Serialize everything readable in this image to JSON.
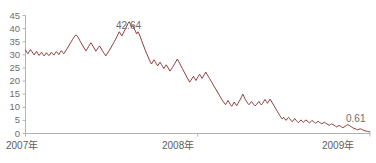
{
  "chart_data": {
    "type": "line",
    "title": "",
    "subtitle": "",
    "xlabel": "",
    "ylabel": "",
    "ylim": [
      0,
      45
    ],
    "ytick_values": [
      0,
      5,
      10,
      15,
      20,
      25,
      30,
      35,
      40,
      45
    ],
    "ytick_labels": [
      "0",
      "5",
      "10",
      "15",
      "20",
      "25",
      "30",
      "35",
      "40",
      "45"
    ],
    "xtick_labels": [
      "2007年",
      "2008年",
      "2009年"
    ],
    "xtick_positions": [
      0.0,
      0.5,
      1.0
    ],
    "grid": false,
    "legend": null,
    "line_color": "#8b3b38",
    "axis_color": "#b0b0b0",
    "series": [
      {
        "name": "price",
        "values": [
          31.8,
          31.0,
          30.4,
          31.2,
          32.0,
          31.4,
          30.6,
          30.0,
          30.7,
          31.3,
          30.5,
          29.8,
          30.4,
          31.0,
          30.2,
          29.6,
          30.1,
          30.8,
          30.2,
          29.7,
          30.3,
          31.0,
          30.4,
          29.9,
          30.6,
          31.2,
          30.7,
          30.1,
          30.9,
          31.6,
          31.0,
          30.4,
          31.1,
          31.9,
          32.6,
          33.4,
          34.2,
          35.0,
          35.8,
          36.5,
          37.2,
          37.6,
          37.1,
          36.3,
          35.4,
          34.6,
          33.8,
          33.0,
          32.2,
          31.5,
          32.3,
          33.1,
          33.9,
          34.6,
          33.8,
          33.0,
          32.2,
          31.4,
          32.1,
          32.8,
          33.4,
          32.6,
          31.8,
          31.0,
          30.3,
          29.6,
          30.3,
          31.1,
          31.8,
          32.6,
          33.4,
          34.2,
          35.1,
          36.0,
          36.9,
          37.9,
          38.8,
          38.0,
          37.2,
          38.1,
          39.0,
          40.0,
          41.0,
          42.0,
          42.64,
          41.6,
          40.5,
          41.2,
          40.2,
          39.0,
          38.0,
          38.8,
          38.0,
          36.8,
          35.5,
          34.2,
          33.0,
          31.8,
          30.6,
          29.5,
          28.4,
          27.4,
          26.5,
          27.3,
          28.1,
          27.4,
          26.6,
          25.8,
          26.5,
          27.2,
          26.4,
          25.6,
          24.8,
          25.5,
          26.2,
          25.4,
          24.6,
          23.8,
          24.5,
          25.2,
          26.0,
          26.8,
          27.6,
          28.4,
          27.5,
          26.6,
          25.7,
          24.8,
          23.9,
          23.0,
          22.1,
          21.2,
          20.4,
          19.6,
          20.3,
          21.0,
          21.8,
          21.0,
          20.2,
          21.0,
          21.8,
          22.6,
          21.8,
          21.0,
          21.8,
          22.6,
          23.4,
          22.6,
          21.8,
          21.0,
          20.2,
          19.4,
          18.6,
          17.8,
          17.0,
          16.2,
          15.4,
          14.6,
          13.8,
          13.0,
          12.3,
          11.6,
          11.0,
          11.8,
          12.6,
          11.8,
          11.0,
          10.4,
          11.2,
          12.0,
          11.3,
          10.6,
          11.4,
          12.2,
          13.0,
          14.0,
          15.0,
          14.0,
          13.0,
          12.2,
          11.5,
          11.0,
          11.6,
          12.2,
          11.6,
          11.0,
          10.5,
          11.0,
          11.6,
          12.2,
          11.5,
          10.9,
          11.5,
          12.3,
          13.0,
          12.2,
          11.5,
          12.3,
          13.1,
          12.4,
          11.6,
          10.8,
          10.0,
          9.2,
          8.4,
          7.6,
          6.8,
          6.1,
          5.5,
          6.2,
          5.6,
          5.0,
          5.6,
          6.2,
          5.6,
          5.0,
          4.5,
          5.1,
          5.7,
          5.1,
          4.6,
          4.1,
          4.6,
          5.2,
          4.7,
          4.2,
          4.7,
          5.2,
          4.8,
          4.4,
          4.0,
          4.5,
          5.0,
          4.6,
          4.2,
          3.9,
          4.3,
          4.7,
          4.3,
          4.0,
          3.7,
          4.0,
          4.3,
          4.0,
          3.7,
          3.4,
          3.1,
          3.4,
          3.7,
          3.4,
          3.1,
          2.8,
          2.5,
          2.8,
          3.1,
          2.8,
          2.5,
          2.2,
          2.5,
          2.8,
          3.1,
          3.4,
          3.1,
          2.8,
          2.5,
          2.2,
          2.0,
          1.8,
          1.6,
          1.4,
          1.6,
          1.8,
          1.6,
          1.4,
          1.2,
          1.0,
          0.9,
          0.8,
          0.7,
          0.61
        ]
      }
    ],
    "annotations": [
      {
        "label": "42.64",
        "value": 42.64,
        "x_frac": 0.255
      },
      {
        "label": "0.61",
        "value": 0.61,
        "x_frac": 0.995
      }
    ]
  }
}
